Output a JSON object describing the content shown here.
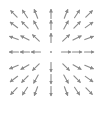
{
  "diagram": {
    "type": "vector-field",
    "grid": {
      "cols": 7,
      "rows": 7
    },
    "center": {
      "x": 51,
      "y": 52
    },
    "col_x": [
      14,
      25,
      36,
      51,
      66,
      77,
      89
    ],
    "row_y": [
      14,
      25,
      38,
      52,
      67,
      79,
      91
    ],
    "arrow_length": 9,
    "center_marker": "dot",
    "colors": {
      "arrow": "#8a8a8a",
      "background": "#ffffff"
    }
  }
}
